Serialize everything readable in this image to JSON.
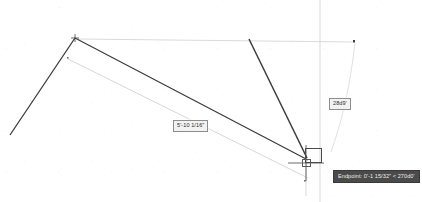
{
  "application": {
    "name": "CAD Drawing Canvas",
    "background_color": "#ffffff"
  },
  "canvas": {
    "width": 422,
    "height": 202,
    "crosshair": {
      "x": 306,
      "y": 163,
      "color": "#5a5a5a"
    },
    "pickbox": {
      "x": 305,
      "y": 148,
      "width": 17,
      "height": 15,
      "color": "#4a4a4a"
    },
    "endpoint_marker": {
      "x": 302,
      "y": 159,
      "width": 9,
      "height": 8,
      "color": "#5a5a5a"
    }
  },
  "colors": {
    "geometry_dark": "#3c3c3c",
    "geometry_light": "#cfcfcf",
    "construction_line": "#d8d8d8",
    "tooltip_background": "#4a4a4a",
    "tooltip_text": "#f0f0f0",
    "label_background": "#f2f2f2",
    "label_border": "#8d8d8d",
    "label_text": "#2b2b2b"
  },
  "geometry": {
    "dark_polyline": {
      "name": "selected-polyline",
      "points": "10,135 75,38 308,160",
      "color": "#3c3c3c",
      "width": 1.3
    },
    "dark_line_right": {
      "name": "right-leg-line",
      "x1": 249,
      "y1": 39,
      "x2": 307,
      "y2": 158,
      "color": "#3c3c3c",
      "width": 1.5
    },
    "light_top_line": {
      "name": "upper-reference-line",
      "x1": 78,
      "y1": 39,
      "x2": 355,
      "y2": 42,
      "color": "#d6d6d6",
      "width": 0.9
    },
    "light_diagonal_line": {
      "name": "lower-reference-line",
      "x1": 68,
      "y1": 59,
      "x2": 308,
      "y2": 178,
      "color": "#d2d2d2",
      "width": 0.9
    },
    "vertical_axis_line": {
      "name": "vertical-construction-axis",
      "x": 320,
      "y1": 0,
      "y2": 202,
      "color": "#d5d5d5",
      "width": 0.9
    },
    "arc_curve": {
      "name": "angle-arc-curve",
      "path": "M 355,42 C 350,75 344,110 330,150",
      "color": "#dcdcdc",
      "width": 0.9
    },
    "node_markers": [
      {
        "name": "apex-node",
        "x": 75,
        "y": 38,
        "color": "#4a4a4a"
      },
      {
        "name": "mid-node",
        "x": 68,
        "y": 58,
        "color": "#6f6f6f"
      },
      {
        "name": "top-right-node",
        "x": 354,
        "y": 41,
        "color": "#3c3c3c"
      },
      {
        "name": "bottom-node",
        "x": 305,
        "y": 181,
        "color": "#6f6f6f"
      }
    ]
  },
  "labels": {
    "dimension_length": "5'-10 1/16\"",
    "dimension_angle": "28d9'"
  },
  "tooltip": {
    "osnap_text": "Endpoint: 0'-1 15/32\" < 270d0'"
  }
}
